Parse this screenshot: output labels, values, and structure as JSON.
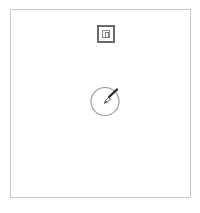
{
  "canvas": {
    "frame_color": "#c8c8c8",
    "background": "#ffffff"
  },
  "controls": {
    "top_button": {
      "icon": "nested-square-icon",
      "color": "#6a6a6a"
    },
    "center_button": {
      "icon": "paintbrush-icon",
      "ring_color": "#999999",
      "brush_color": "#222222"
    }
  }
}
